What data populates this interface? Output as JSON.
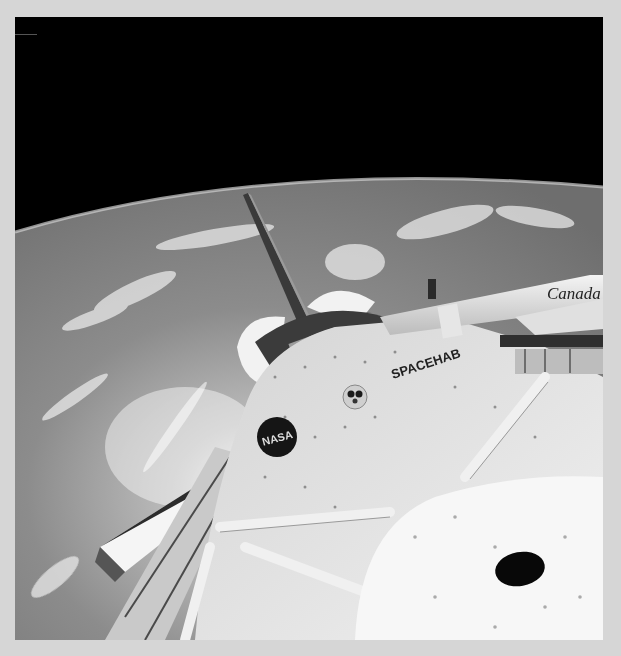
{
  "image": {
    "subject": "Space Shuttle payload bay with SPACEHAB module and Canadarm over Earth",
    "palette": {
      "frame_bg": "#d6d6d6",
      "space": "#000000",
      "earth": "#8f8f8f",
      "clouds": "#e6e6e6",
      "module": "#e8e8e8",
      "hardware_dark": "#2a2a2a"
    }
  },
  "labels": {
    "spacehab": "SPACEHAB",
    "nasa": "NASA",
    "canada": "Canada"
  }
}
